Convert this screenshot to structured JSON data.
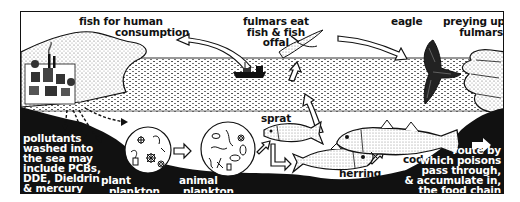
{
  "diagram": {
    "type": "food-chain illustration",
    "colors": {
      "ink": "#111111",
      "paper": "#ffffff"
    },
    "labels": {
      "fish_for_human": [
        "fish for human",
        "consumption"
      ],
      "fulmars_eat": [
        "fulmars eat",
        "fish & fish",
        "offal"
      ],
      "eagle": "eagle",
      "preying": [
        "preying upon",
        "fulmars"
      ],
      "sprat": "sprat",
      "herring": "herring",
      "cod": "cod",
      "plant_plankton": [
        "plant",
        "plankton"
      ],
      "animal_plankton": [
        "animal",
        "plankton"
      ],
      "pollutants": [
        "pollutants",
        "washed into",
        "the sea may",
        "include PCBs,",
        "DDE, Dieldrin",
        "& mercury"
      ],
      "legend": [
        "route by",
        "which poisons",
        "pass through,",
        "& accumulate in,",
        "the food chain"
      ]
    },
    "nodes": [
      "factory town",
      "plant plankton",
      "animal plankton",
      "sprat",
      "herring",
      "cod",
      "fishing boat",
      "fulmar",
      "eagle"
    ],
    "edges": [
      {
        "from": "factory town",
        "to": "plant plankton"
      },
      {
        "from": "plant plankton",
        "to": "animal plankton"
      },
      {
        "from": "animal plankton",
        "to": "sprat"
      },
      {
        "from": "sprat",
        "to": "herring"
      },
      {
        "from": "herring",
        "to": "cod"
      },
      {
        "from": "cod",
        "to": "fulmar"
      },
      {
        "from": "fishing boat",
        "to": "fulmar"
      },
      {
        "from": "fishing boat",
        "to": "fish for human consumption"
      },
      {
        "from": "fulmar",
        "to": "eagle"
      }
    ]
  }
}
